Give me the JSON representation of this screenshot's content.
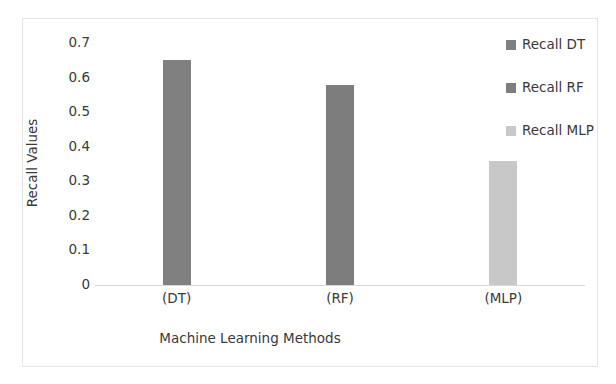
{
  "chart_data": {
    "type": "bar",
    "title": "",
    "categories": [
      "(DT)",
      "(RF)",
      "(MLP)"
    ],
    "values": [
      0.65,
      0.58,
      0.36
    ],
    "series": [
      {
        "name": "Recall DT",
        "values": [
          0.65,
          null,
          null
        ],
        "color": "#808080"
      },
      {
        "name": "Recall RF",
        "values": [
          null,
          0.58,
          null
        ],
        "color": "#7d7d7d"
      },
      {
        "name": "Recall MLP",
        "values": [
          null,
          null,
          0.36
        ],
        "color": "#c8c8c8"
      }
    ],
    "xlabel": "Machine Learning Methods",
    "ylabel": "Recall Values",
    "ylim": [
      0,
      0.7
    ],
    "ytick_labels": [
      "0.7",
      "0.6",
      "0.5",
      "0.4",
      "0.3",
      "0.2",
      "0.1",
      "0"
    ],
    "ytick_values": [
      0.7,
      0.6,
      0.5,
      0.4,
      0.3,
      0.2,
      0.1,
      0
    ],
    "grid": false,
    "legend_position": "right",
    "bar_colors": [
      "#808080",
      "#7d7d7d",
      "#c8c8c8"
    ]
  },
  "legend": {
    "items": [
      {
        "label": "Recall DT",
        "color": "#808080"
      },
      {
        "label": "Recall RF",
        "color": "#7d7d7d"
      },
      {
        "label": "Recall MLP",
        "color": "#c8c8c8"
      }
    ]
  },
  "axes": {
    "x_title": "Machine Learning Methods",
    "y_title": "Recall Values"
  },
  "colors": {
    "frame_border": "#e6e6e6",
    "axis_line": "#d9d9d9",
    "text": "#3a3a3a",
    "background": "#ffffff"
  }
}
